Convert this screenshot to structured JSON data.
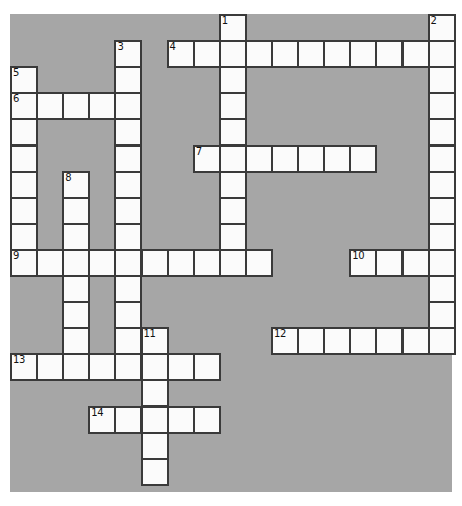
{
  "puzzle": {
    "type": "crossword-grid",
    "title": "",
    "background_color": "#a6a6a6",
    "cell_fill_color": "#fbfbfb",
    "cell_border_color": "#3a3a3a",
    "page_background": "#ffffff",
    "grid": {
      "origin_x": 10,
      "origin_y": 14,
      "cell_size": 26.1,
      "columns": 17,
      "rows": 18,
      "board_width": 442,
      "board_height": 478
    },
    "entries": [
      {
        "number": "1",
        "direction": "down",
        "col": 8,
        "row": 0,
        "length": 10
      },
      {
        "number": "2",
        "direction": "down",
        "col": 16,
        "row": 0,
        "length": 13
      },
      {
        "number": "3",
        "direction": "down",
        "col": 4,
        "row": 1,
        "length": 12
      },
      {
        "number": "4",
        "direction": "across",
        "col": 6,
        "row": 1,
        "length": 10
      },
      {
        "number": "5",
        "direction": "down",
        "col": 0,
        "row": 2,
        "length": 8
      },
      {
        "number": "6",
        "direction": "across",
        "col": 0,
        "row": 3,
        "length": 5
      },
      {
        "number": "7",
        "direction": "across",
        "col": 7,
        "row": 5,
        "length": 7
      },
      {
        "number": "8",
        "direction": "down",
        "col": 2,
        "row": 6,
        "length": 8
      },
      {
        "number": "9",
        "direction": "across",
        "col": 0,
        "row": 9,
        "length": 10
      },
      {
        "number": "10",
        "direction": "across",
        "col": 13,
        "row": 9,
        "length": 4
      },
      {
        "number": "11",
        "direction": "down",
        "col": 5,
        "row": 12,
        "length": 6
      },
      {
        "number": "12",
        "direction": "across",
        "col": 10,
        "row": 12,
        "length": 7
      },
      {
        "number": "13",
        "direction": "across",
        "col": 0,
        "row": 13,
        "length": 8
      },
      {
        "number": "14",
        "direction": "across",
        "col": 3,
        "row": 15,
        "length": 5
      }
    ],
    "numbers": [
      "1",
      "2",
      "3",
      "4",
      "5",
      "6",
      "7",
      "8",
      "9",
      "10",
      "11",
      "12",
      "13",
      "14"
    ]
  }
}
